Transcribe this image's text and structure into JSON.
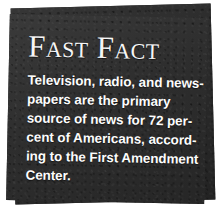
{
  "callout": {
    "kind": "fast-fact-callout",
    "headline": "Fast Fact",
    "body_lines": [
      "Television, radio, and news-",
      "papers are the primary",
      "source of news for 72 per-",
      "cent of Americans, accord-",
      "ing to the First Amendment",
      "Center."
    ],
    "body_text": "Television, radio, and newspapers are the primary source of news for 72 percent of Americans, according to the First Amendment Center.",
    "statistic": "72 percent",
    "source": "First Amendment Center",
    "colors": {
      "card_front": "#2f2f2f",
      "card_back": "#2b2b2b",
      "text": "#ffffff",
      "page_background": "#ffffff"
    }
  }
}
